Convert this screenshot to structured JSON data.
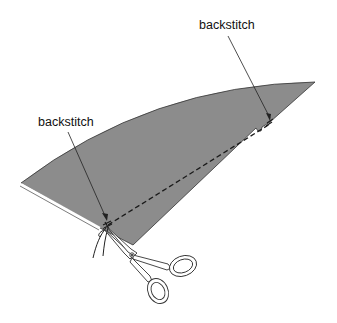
{
  "diagram": {
    "type": "sewing-illustration",
    "labels": [
      {
        "id": "backstitch-top",
        "text": "backstitch"
      },
      {
        "id": "backstitch-left",
        "text": "backstitch"
      }
    ],
    "elements": {
      "fabric": {
        "color": "#8c8c8c",
        "outline": "#333333"
      },
      "stitch_line": {
        "style": "dashed",
        "color": "#1a1a1a"
      },
      "scissors": {
        "fill": "#ffffff",
        "outline": "#333333"
      },
      "thread_ends": {
        "color": "#222222"
      }
    }
  }
}
